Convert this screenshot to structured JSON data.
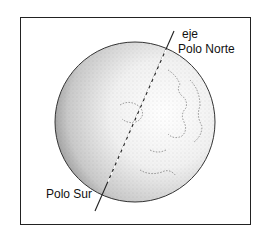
{
  "diagram": {
    "labels": {
      "axis": "eje",
      "north_pole": "Polo Norte",
      "south_pole": "Polo Sur"
    },
    "colors": {
      "stroke": "#222222",
      "background": "#ffffff"
    }
  }
}
